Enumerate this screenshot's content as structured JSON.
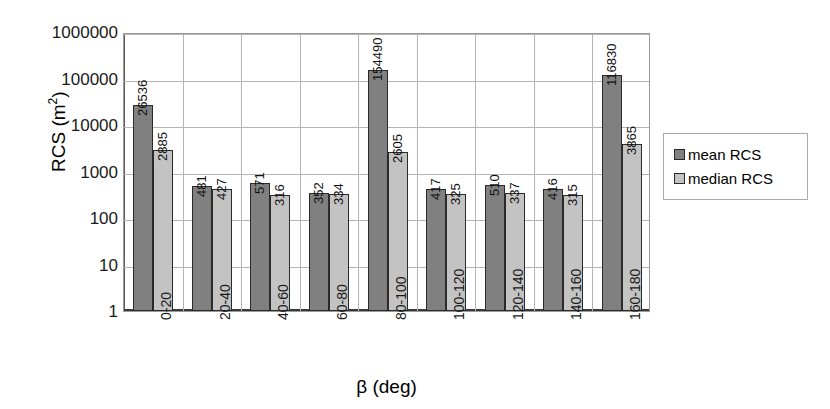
{
  "chart_data": {
    "type": "bar",
    "title": "",
    "xlabel": "β (deg)",
    "ylabel_text": "RCS (m",
    "ylabel_sup": "2",
    "ylabel_tail": ")",
    "categories": [
      "0-20",
      "20-40",
      "40-60",
      "60-80",
      "80-100",
      "100-120",
      "120-140",
      "140-160",
      "160-180"
    ],
    "series": [
      {
        "name": "mean RCS",
        "color": "#808080",
        "values": [
          26536,
          481,
          571,
          352,
          154490,
          417,
          510,
          416,
          116830
        ]
      },
      {
        "name": "median RCS",
        "color": "#c3c3c3",
        "values": [
          2885,
          427,
          316,
          334,
          2605,
          325,
          337,
          315,
          3865
        ]
      }
    ],
    "yscale": "log",
    "ylim": [
      1,
      1000000
    ],
    "ytick_labels": [
      "1000000",
      "100000",
      "10000",
      "1000",
      "100",
      "10",
      "1"
    ],
    "ytick_values": [
      1000000,
      100000,
      10000,
      1000,
      100,
      10,
      1
    ],
    "grid": {
      "horizontal": true,
      "vertical": true
    },
    "legend_position": "right"
  },
  "legend": {
    "entries": [
      {
        "label": "mean RCS",
        "swatch": "mean"
      },
      {
        "label": "median RCS",
        "swatch": "median"
      }
    ]
  }
}
